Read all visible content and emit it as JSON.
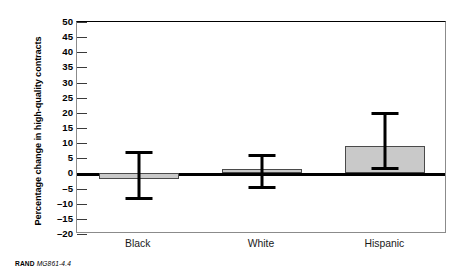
{
  "chart_data": {
    "type": "bar",
    "title": "",
    "xlabel": "",
    "ylabel": "Percentage change in high-quality contracts",
    "categories": [
      "Black",
      "White",
      "Hispanic"
    ],
    "values": [
      -2,
      1.5,
      9
    ],
    "error_low": [
      -8,
      -4.5,
      1.7
    ],
    "error_high": [
      7,
      6,
      20
    ],
    "ylim": [
      -20,
      50
    ],
    "yticks": [
      50,
      45,
      40,
      35,
      30,
      25,
      20,
      15,
      10,
      5,
      0,
      -5,
      -10,
      -15,
      -20
    ],
    "ytick_labels": [
      "50",
      "45",
      "40",
      "35",
      "30",
      "25",
      "20",
      "15",
      "10",
      "5",
      "0",
      "–5",
      "–10",
      "–15",
      "–20"
    ],
    "grid": false,
    "legend": null,
    "error_bar_style": "capped-vertical",
    "bar_color": "#c9c9c9",
    "bar_edge_color": "#4a4a4a",
    "zero_line_color": "#000000"
  },
  "footer": {
    "source": "RAND",
    "figure_id": "MG861-4.4"
  }
}
